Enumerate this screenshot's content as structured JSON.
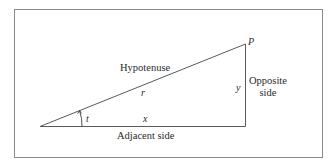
{
  "diagram": {
    "type": "right-triangle",
    "labels": {
      "hypotenuse": "Hypotenuse",
      "opposite_line1": "Opposite",
      "opposite_line2": "side",
      "adjacent": "Adjacent side",
      "point": "P",
      "r": "r",
      "x": "x",
      "y": "y",
      "angle": "t"
    },
    "colors": {
      "stroke": "#5a5a5a",
      "frame": "#8a8a8a",
      "text": "#2a2a2a"
    }
  }
}
